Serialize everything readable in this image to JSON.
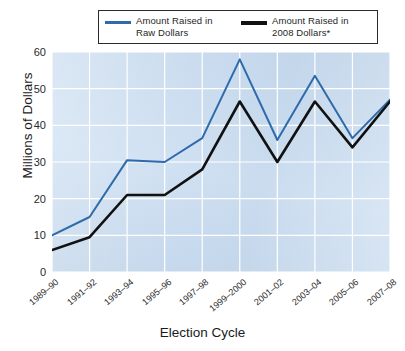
{
  "chart_data": {
    "type": "line",
    "title": "",
    "xlabel": "Election Cycle",
    "ylabel": "Millions of Dollars",
    "categories": [
      "1989–90",
      "1991–92",
      "1993–94",
      "1995–96",
      "1997–98",
      "1999–2000",
      "2001–02",
      "2003–04",
      "2005–06",
      "2007–08"
    ],
    "ylim": [
      0,
      60
    ],
    "yticks": [
      0,
      10,
      20,
      30,
      40,
      50,
      60
    ],
    "grid": true,
    "legend_position": "top",
    "series": [
      {
        "name": "Amount Raised in Raw Dollars",
        "color": "#2e6bab",
        "values": [
          10,
          15,
          30.5,
          30,
          36.5,
          58,
          36,
          53.5,
          36.5,
          47
        ]
      },
      {
        "name": "Amount Raised in 2008 Dollars*",
        "color": "#111111",
        "values": [
          6,
          9.5,
          21,
          21,
          28,
          46.5,
          30,
          46.5,
          34,
          46.5
        ]
      }
    ]
  },
  "legend": {
    "entries": [
      {
        "label": "Amount Raised in\nRaw Dollars",
        "swatch": "raw"
      },
      {
        "label": "Amount Raised in\n2008 Dollars*",
        "swatch": "adj"
      }
    ]
  },
  "axes": {
    "y_title": "Millions of Dollars",
    "x_title": "Election Cycle",
    "y_tick_labels": [
      "60",
      "50",
      "40",
      "30",
      "20",
      "10",
      "0"
    ],
    "x_tick_labels": [
      "1989–90",
      "1991–92",
      "1993–94",
      "1995–96",
      "1997–98",
      "1999–2000",
      "2001–02",
      "2003–04",
      "2005–06",
      "2007–08"
    ]
  },
  "colors": {
    "plot_background": "#cfe0f2",
    "gridline": "#ffffff",
    "series_raw": "#2e6bab",
    "series_adjusted": "#111111",
    "legend_border": "#2b2b2b"
  }
}
